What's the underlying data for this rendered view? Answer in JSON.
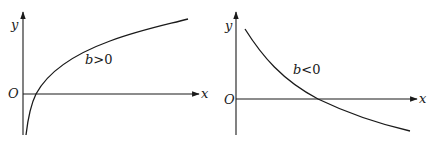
{
  "figures": [
    {
      "name": "log-graph-b-positive",
      "axis_x_label": "x",
      "axis_y_label": "y",
      "origin_label": "O",
      "curve_label_var": "b",
      "curve_label_rel": ">0"
    },
    {
      "name": "log-graph-b-negative",
      "axis_x_label": "x",
      "axis_y_label": "y",
      "origin_label": "O",
      "curve_label_var": "b",
      "curve_label_rel": "<0"
    }
  ]
}
